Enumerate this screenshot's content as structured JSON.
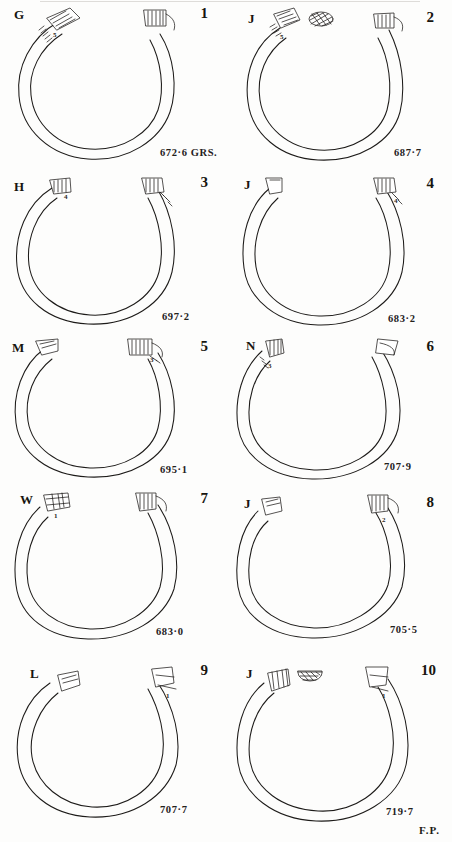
{
  "plate": {
    "signature": "F.P.",
    "background_color": "#fdfdfc",
    "ink_color": "#1d1b19",
    "weight_unit_label": "GRS.",
    "figure_count": 10
  },
  "figures": [
    {
      "number": "1",
      "letter": "G",
      "weight": "672·6 GRS.",
      "micro_annotation": "5",
      "left_terminal": "diagonal-hatched-terminal",
      "right_terminal": "vertical-hatched-terminal",
      "has_section_oval": false,
      "gap_orientation": "top"
    },
    {
      "number": "2",
      "letter": "J",
      "weight": "687·7",
      "micro_annotation": "5",
      "left_terminal": "diagonal-hatched-terminal",
      "right_terminal": "vertical-hatched-terminal",
      "has_section_oval": true,
      "gap_orientation": "top"
    },
    {
      "number": "3",
      "letter": "H",
      "weight": "697·2",
      "micro_annotation": "4",
      "left_terminal": "plain-terminal",
      "right_terminal": "ribbed-terminal",
      "has_section_oval": false,
      "gap_orientation": "top"
    },
    {
      "number": "4",
      "letter": "J",
      "weight": "683·2",
      "micro_annotation": "4",
      "left_terminal": "plain-terminal",
      "right_terminal": "ribbed-terminal",
      "has_section_oval": false,
      "gap_orientation": "top"
    },
    {
      "number": "5",
      "letter": "M",
      "weight": "695·1",
      "micro_annotation": "3",
      "left_terminal": "plain-terminal",
      "right_terminal": "vertical-hatched-terminal",
      "has_section_oval": false,
      "gap_orientation": "top"
    },
    {
      "number": "6",
      "letter": "N",
      "weight": "707·9",
      "micro_annotation": "3",
      "left_terminal": "vertical-hatched-terminal",
      "right_terminal": "plain-terminal",
      "has_section_oval": false,
      "gap_orientation": "top"
    },
    {
      "number": "7",
      "letter": "W",
      "weight": "683·0",
      "micro_annotation": "1",
      "left_terminal": "banded-terminal",
      "right_terminal": "ribbed-terminal",
      "has_section_oval": false,
      "gap_orientation": "top"
    },
    {
      "number": "8",
      "letter": "J",
      "weight": "705·5",
      "micro_annotation": "2",
      "left_terminal": "plain-terminal",
      "right_terminal": "vertical-hatched-terminal",
      "has_section_oval": false,
      "gap_orientation": "top"
    },
    {
      "number": "9",
      "letter": "L",
      "weight": "707·7",
      "micro_annotation": "1",
      "left_terminal": "plain-terminal",
      "right_terminal": "plain-terminal",
      "has_section_oval": false,
      "gap_orientation": "top"
    },
    {
      "number": "10",
      "letter": "J",
      "weight": "719·7",
      "micro_annotation": "1",
      "left_terminal": "ribbed-terminal",
      "right_terminal": "plain-terminal",
      "has_section_oval": true,
      "gap_orientation": "top"
    }
  ]
}
